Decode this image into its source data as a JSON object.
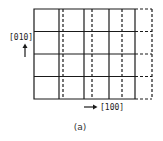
{
  "figure": {
    "caption": "(a)",
    "y_axis_label": "[010]",
    "x_axis_label": "[100]",
    "colors": {
      "line": "#1a1a1a",
      "background": "#ffffff"
    }
  },
  "grid": {
    "rows": 4,
    "solid_columns": 5,
    "dashed_columns_interleaved": 3,
    "dashed_extension_column": true
  },
  "icons": {
    "y_arrow": "arrow-up-icon",
    "x_arrow": "arrow-right-icon"
  }
}
